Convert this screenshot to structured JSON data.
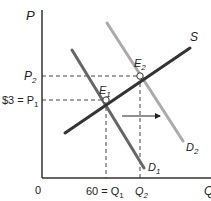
{
  "diagram": {
    "axes": {
      "y_label": "P",
      "x_label": "Q",
      "origin_label": "0"
    },
    "price_labels": {
      "p2": "P",
      "p2_sub": "2",
      "p1_prefix": "$3 = P",
      "p1_sub": "1"
    },
    "quantity_labels": {
      "q1_prefix": "60 = Q",
      "q1_sub": "1",
      "q2": "Q",
      "q2_sub": "2"
    },
    "curves": [
      {
        "name": "S",
        "label": "S",
        "color": "#333333",
        "from": [
          65,
          133
        ],
        "to": [
          190,
          48
        ]
      },
      {
        "name": "D1",
        "label": "D",
        "sub": "1",
        "color": "#666666",
        "from": [
          72,
          50
        ],
        "to": [
          144,
          168
        ]
      },
      {
        "name": "D2",
        "label": "D",
        "sub": "2",
        "color": "#aaaaaa",
        "from": [
          107,
          23
        ],
        "to": [
          183,
          141
        ]
      }
    ],
    "equilibria": [
      {
        "name": "E1",
        "label": "E",
        "sub": "1",
        "point": [
          106,
          100
        ],
        "price": "$3",
        "quantity": "60"
      },
      {
        "name": "E2",
        "label": "E",
        "sub": "2",
        "point": [
          140,
          76
        ]
      }
    ],
    "shift_arrow": {
      "from": [
        122,
        116
      ],
      "to": [
        161,
        116
      ],
      "direction": "right"
    }
  }
}
